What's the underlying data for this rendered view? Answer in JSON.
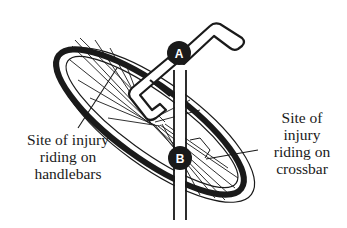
{
  "diagram": {
    "colors": {
      "ink": "#1a1a1a",
      "background": "#ffffff",
      "marker_fill": "#1a1a1a",
      "marker_text": "#ffffff"
    },
    "markers": [
      {
        "id": "A",
        "label": "A"
      },
      {
        "id": "B",
        "label": "B"
      }
    ],
    "labels": {
      "handlebars": {
        "lines": [
          "Site of injury",
          "riding on",
          "handlebars"
        ]
      },
      "crossbar": {
        "lines": [
          "Site of",
          "injury",
          "riding on",
          "crossbar"
        ]
      }
    }
  }
}
